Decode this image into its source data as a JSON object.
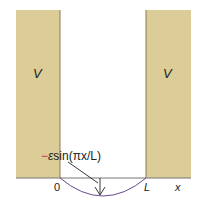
{
  "diagram": {
    "left_wall_label": "V",
    "right_wall_label": "V",
    "perturbation_label_minus": "−",
    "perturbation_label_eps": "ε",
    "perturbation_label_rest": "sin(πx/L)",
    "origin_label": "0",
    "well_width_label": "L",
    "axis_label": "x",
    "colors": {
      "wall_fill": "#dccd98",
      "wall_edge": "#8a7a50",
      "curve": "#6a4a8a",
      "minus_sign": "#d0204a",
      "baseline": "#777777"
    }
  }
}
